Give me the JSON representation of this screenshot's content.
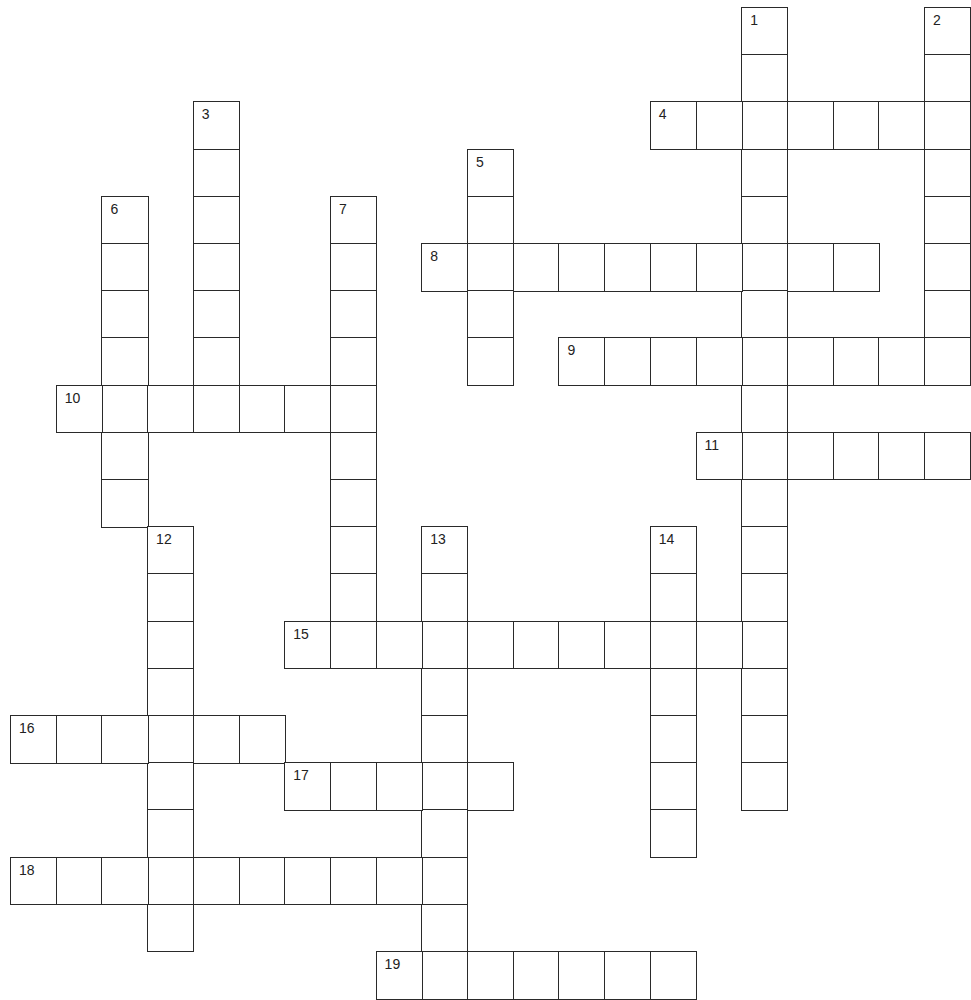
{
  "puzzle": {
    "type": "crossword",
    "grid": {
      "origin_x": 10,
      "origin_y": 7,
      "cell_w": 45.7,
      "cell_h": 47.2,
      "cols": 21,
      "rows": 21
    },
    "entries": [
      {
        "number": "1",
        "direction": "down",
        "row": 0,
        "col": 16,
        "length": 17
      },
      {
        "number": "2",
        "direction": "down",
        "row": 0,
        "col": 20,
        "length": 8
      },
      {
        "number": "3",
        "direction": "down",
        "row": 2,
        "col": 4,
        "length": 7
      },
      {
        "number": "4",
        "direction": "across",
        "row": 2,
        "col": 14,
        "length": 7
      },
      {
        "number": "5",
        "direction": "down",
        "row": 3,
        "col": 10,
        "length": 5
      },
      {
        "number": "6",
        "direction": "down",
        "row": 4,
        "col": 2,
        "length": 7
      },
      {
        "number": "7",
        "direction": "down",
        "row": 4,
        "col": 7,
        "length": 10
      },
      {
        "number": "8",
        "direction": "across",
        "row": 5,
        "col": 9,
        "length": 10
      },
      {
        "number": "9",
        "direction": "across",
        "row": 7,
        "col": 12,
        "length": 9
      },
      {
        "number": "10",
        "direction": "across",
        "row": 8,
        "col": 1,
        "length": 7
      },
      {
        "number": "11",
        "direction": "across",
        "row": 9,
        "col": 15,
        "length": 6
      },
      {
        "number": "12",
        "direction": "down",
        "row": 11,
        "col": 3,
        "length": 9
      },
      {
        "number": "13",
        "direction": "down",
        "row": 11,
        "col": 9,
        "length": 10
      },
      {
        "number": "14",
        "direction": "down",
        "row": 11,
        "col": 14,
        "length": 7
      },
      {
        "number": "15",
        "direction": "across",
        "row": 13,
        "col": 6,
        "length": 11
      },
      {
        "number": "16",
        "direction": "across",
        "row": 15,
        "col": 0,
        "length": 6
      },
      {
        "number": "17",
        "direction": "across",
        "row": 16,
        "col": 6,
        "length": 5
      },
      {
        "number": "18",
        "direction": "across",
        "row": 18,
        "col": 0,
        "length": 10
      },
      {
        "number": "19",
        "direction": "across",
        "row": 20,
        "col": 8,
        "length": 7
      }
    ]
  }
}
